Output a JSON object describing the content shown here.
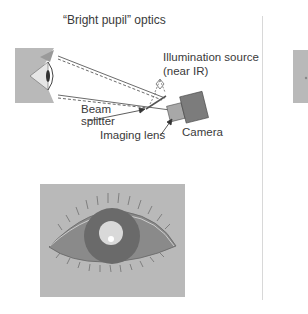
{
  "figure": {
    "title": "“Bright pupil” optics",
    "labels": {
      "illumination_source": "Illumination source",
      "near_ir": "(near IR)",
      "beam": "Beam",
      "splitter": "splitter",
      "imaging_lens": "Imaging lens",
      "camera": "Camera"
    },
    "panels": [
      {
        "name": "optics-setup",
        "description": "Side view of eye with beam splitter, illumination source, imaging lens and camera"
      },
      {
        "name": "bright-pupil-eye",
        "description": "Front view of eye with bright pupil and corneal reflection"
      }
    ],
    "colors": {
      "panel_gray": "#b9b9b9",
      "iris": "#6e6e6e",
      "pupil": "#d9d9d9",
      "camera_body": "#7c7c7c",
      "camera_lens": "#a8a8a8",
      "text": "#3a3a3a"
    }
  }
}
